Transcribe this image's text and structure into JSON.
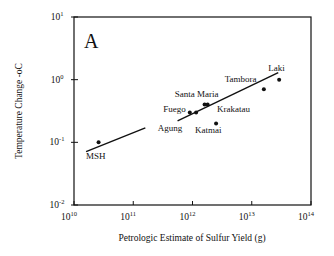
{
  "chart_data": {
    "type": "scatter",
    "panel_label": "A",
    "title": "",
    "xlabel": "Petrologic Estimate of Sulfur Yield (g)",
    "ylabel": "Temperature Change -oC",
    "xscale": "log",
    "yscale": "log",
    "xlim": [
      10000000000.0,
      100000000000000.0
    ],
    "ylim": [
      0.01,
      10
    ],
    "x_ticks": [
      {
        "value": 10000000000.0,
        "base": "10",
        "exp": "10"
      },
      {
        "value": 100000000000.0,
        "base": "10",
        "exp": "11"
      },
      {
        "value": 1000000000000.0,
        "base": "10",
        "exp": "12"
      },
      {
        "value": 10000000000000.0,
        "base": "10",
        "exp": "13"
      },
      {
        "value": 100000000000000.0,
        "base": "10",
        "exp": "14"
      }
    ],
    "y_ticks": [
      {
        "value": 0.01,
        "base": "10",
        "exp": "-2"
      },
      {
        "value": 0.1,
        "base": "10",
        "exp": "-1"
      },
      {
        "value": 1,
        "base": "10",
        "exp": "0"
      },
      {
        "value": 10,
        "base": "10",
        "exp": "1"
      }
    ],
    "grid": false,
    "legend": null,
    "points": [
      {
        "name": "MSH",
        "x": 26000000000.0,
        "y": 0.1
      },
      {
        "name": "Fuego",
        "x": 900000000000.0,
        "y": 0.3
      },
      {
        "name": "Agung",
        "x": 1150000000000.0,
        "y": 0.3
      },
      {
        "name": "Santa Maria",
        "x": 1600000000000.0,
        "y": 0.4
      },
      {
        "name": "Santa Maria",
        "x": 1800000000000.0,
        "y": 0.4
      },
      {
        "name": "Katmai",
        "x": 2500000000000.0,
        "y": 0.2
      },
      {
        "name": "Tambora",
        "x": 16000000000000.0,
        "y": 0.7
      },
      {
        "name": "Laki",
        "x": 29000000000000.0,
        "y": 1.0
      }
    ],
    "labels": [
      {
        "text": "MSH",
        "x": 16000000000.0,
        "y": 0.055
      },
      {
        "text": "Agung",
        "x": 260000000000.0,
        "y": 0.15
      },
      {
        "text": "Fuego",
        "x": 320000000000.0,
        "y": 0.3
      },
      {
        "text": "Santa Maria",
        "x": 500000000000.0,
        "y": 0.53
      },
      {
        "text": "Katmai",
        "x": 1100000000000.0,
        "y": 0.14
      },
      {
        "text": "Krakatau",
        "x": 2600000000000.0,
        "y": 0.3
      },
      {
        "text": "Tambora",
        "x": 3500000000000.0,
        "y": 0.92
      },
      {
        "text": "Laki",
        "x": 19000000000000.0,
        "y": 1.35
      }
    ],
    "fit_line": {
      "segments": [
        {
          "x": [
            16000000000.0,
            160000000000.0
          ],
          "y": [
            0.071,
            0.17
          ]
        },
        {
          "x": [
            560000000000.0,
            28000000000000.0
          ],
          "y": [
            0.22,
            1.3
          ]
        }
      ]
    }
  }
}
